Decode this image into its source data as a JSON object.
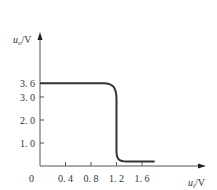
{
  "chart_data": {
    "type": "line",
    "title": "",
    "xlabel": "u_i/V",
    "ylabel": "u_o/V",
    "xlabel_parts": {
      "var": "u",
      "sub": "i",
      "unit": "/V"
    },
    "ylabel_parts": {
      "var": "u",
      "sub": "o",
      "unit": "/V"
    },
    "origin_label": "0",
    "x_ticks": [
      {
        "value": 0.4,
        "label": "0. 4"
      },
      {
        "value": 0.8,
        "label": "0. 8"
      },
      {
        "value": 1.2,
        "label": "1. 2"
      },
      {
        "value": 1.6,
        "label": "1. 6"
      }
    ],
    "y_ticks": [
      {
        "value": 1.0,
        "label": "1. 0"
      },
      {
        "value": 2.0,
        "label": "2. 0"
      },
      {
        "value": 3.0,
        "label": "3. 0"
      },
      {
        "value": 3.6,
        "label": "3. 6"
      }
    ],
    "xlim": [
      0,
      2.1
    ],
    "ylim": [
      0,
      5.0
    ],
    "grid": false,
    "legend": null,
    "series": [
      {
        "name": "u_o vs u_i (voltage transfer characteristic)",
        "x": [
          0.0,
          0.9,
          1.0,
          1.12,
          1.2,
          1.2,
          1.22,
          1.3,
          1.8
        ],
        "y": [
          3.6,
          3.6,
          3.6,
          3.4,
          3.0,
          0.5,
          0.25,
          0.2,
          0.2
        ]
      }
    ],
    "color": "#333333"
  }
}
